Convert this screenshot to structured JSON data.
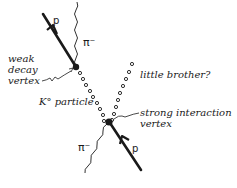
{
  "diagram": {
    "labels": {
      "proton_out": "p",
      "pion_out": "π⁻",
      "weak_vertex": [
        "weak",
        "decay",
        "vertex"
      ],
      "k_particle": "K° particle",
      "little_brother": "little brother?",
      "strong_vertex": [
        "strong interaction",
        "vertex"
      ],
      "pion_in": "π⁻",
      "proton_in": "p"
    },
    "colors": {
      "ink": "#1a1a1a",
      "background": "#ffffff"
    }
  }
}
